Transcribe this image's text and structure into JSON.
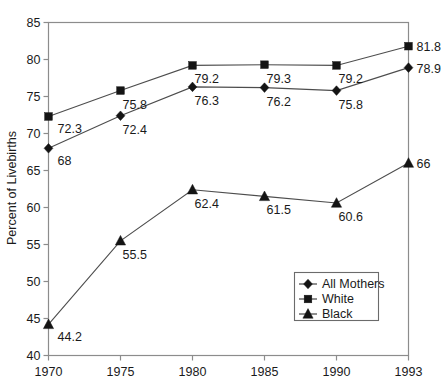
{
  "chart_data": {
    "type": "line",
    "title": "",
    "xlabel": "",
    "ylabel": "Percent of Livebirths",
    "categories": [
      "1970",
      "1975",
      "1980",
      "1985",
      "1990",
      "1993"
    ],
    "ylim": [
      40,
      85
    ],
    "yticks": [
      40,
      45,
      50,
      55,
      60,
      65,
      70,
      75,
      80,
      85
    ],
    "ytick_labels": [
      "40",
      "45",
      "50",
      "55",
      "60",
      "65",
      "70",
      "75",
      "80",
      "85"
    ],
    "grid": false,
    "legend_position": "lower-right-inside",
    "series": [
      {
        "name": "All Mothers",
        "marker": "diamond",
        "values": [
          68,
          72.4,
          76.3,
          76.2,
          75.8,
          78.9
        ],
        "labels": [
          "68",
          "72.4",
          "76.3",
          "76.2",
          "75.8",
          "78.9"
        ]
      },
      {
        "name": "White",
        "marker": "square",
        "values": [
          72.3,
          75.8,
          79.2,
          79.3,
          79.2,
          81.8
        ],
        "labels": [
          "72.3",
          "75.8",
          "79.2",
          "79.3",
          "79.2",
          "81.8"
        ]
      },
      {
        "name": "Black",
        "marker": "triangle",
        "values": [
          44.2,
          55.5,
          62.4,
          61.5,
          60.6,
          66
        ],
        "labels": [
          "44.2",
          "55.5",
          "62.4",
          "61.5",
          "60.6",
          "66"
        ]
      }
    ]
  },
  "axes": {
    "y_title": "Percent of Livebirths",
    "y_ticks": [
      "85",
      "80",
      "75",
      "70",
      "65",
      "60",
      "55",
      "50",
      "45",
      "40"
    ],
    "x_ticks": [
      "1970",
      "1975",
      "1980",
      "1985",
      "1990",
      "1993"
    ]
  },
  "legend": {
    "items": [
      {
        "label": "All Mothers",
        "marker": "diamond"
      },
      {
        "label": "White",
        "marker": "square"
      },
      {
        "label": "Black",
        "marker": "triangle"
      }
    ]
  },
  "point_labels": {
    "all_mothers": [
      "68",
      "72.4",
      "76.3",
      "76.2",
      "75.8",
      "78.9"
    ],
    "white": [
      "72.3",
      "75.8",
      "79.2",
      "79.3",
      "79.2",
      "81.8"
    ],
    "black": [
      "44.2",
      "55.5",
      "62.4",
      "61.5",
      "60.6",
      "66"
    ]
  },
  "colors": {
    "frame": "#8c8c8c",
    "line": "#4d4d4d",
    "marker": "#141414",
    "text": "#1a1a1a",
    "background": "#ffffff"
  }
}
